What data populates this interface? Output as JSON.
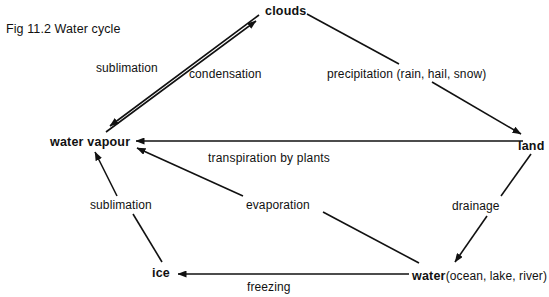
{
  "figure": {
    "caption": "Fig 11.2  Water cycle",
    "type": "cycle-diagram",
    "title": "Water cycle"
  },
  "nodes": [
    {
      "id": "water-vapour",
      "label": "water vapour"
    },
    {
      "id": "clouds",
      "label": "clouds"
    },
    {
      "id": "land",
      "label": "land"
    },
    {
      "id": "ice",
      "label": "ice"
    },
    {
      "id": "water-body",
      "label": "water",
      "detail": "(ocean, lake, river)"
    }
  ],
  "edges": [
    {
      "id": "sublimation-top",
      "label": "sublimation",
      "from": "clouds",
      "to": "water-vapour"
    },
    {
      "id": "condensation",
      "label": "condensation",
      "from": "water-vapour",
      "to": "clouds"
    },
    {
      "id": "precipitation",
      "label": "precipitation (rain, hail, snow)",
      "from": "clouds",
      "to": "land"
    },
    {
      "id": "transpiration",
      "label": "transpiration  by  plants",
      "from": "land",
      "to": "water-vapour"
    },
    {
      "id": "sublimation-bottom",
      "label": "sublimation",
      "from": "ice",
      "to": "water-vapour"
    },
    {
      "id": "evaporation",
      "label": "evaporation",
      "from": "water-body",
      "to": "water-vapour"
    },
    {
      "id": "drainage",
      "label": "drainage",
      "from": "land",
      "to": "water-body"
    },
    {
      "id": "freezing",
      "label": "freezing",
      "from": "water-body",
      "to": "ice"
    }
  ],
  "colors": {
    "ink": "#111111",
    "background": "#ffffff"
  }
}
